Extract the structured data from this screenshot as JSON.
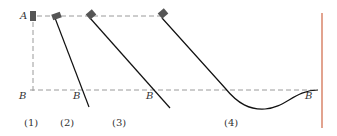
{
  "diagram": {
    "point_labels": {
      "A": "A",
      "B": "B"
    },
    "cases": [
      {
        "id": "1",
        "label": "(1)",
        "path_type": "vertical-drop"
      },
      {
        "id": "2",
        "label": "(2)",
        "path_type": "steep-incline"
      },
      {
        "id": "3",
        "label": "(3)",
        "path_type": "moderate-incline"
      },
      {
        "id": "4",
        "label": "(4)",
        "path_type": "incline-with-dip-curve"
      }
    ],
    "colors": {
      "block": "#555555",
      "track": "#111111",
      "dashed": "#999999",
      "vertical_bar": "#d9856a",
      "text": "#333333"
    }
  }
}
